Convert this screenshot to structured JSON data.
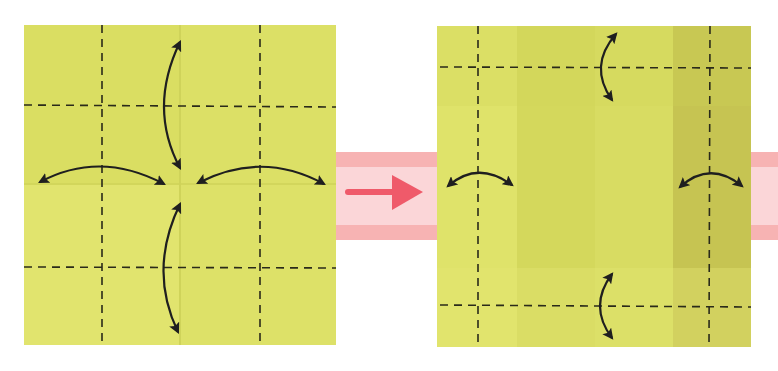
{
  "diagram": {
    "colors": {
      "paper_light": "#dfe36a",
      "paper_mid": "#d2d65a",
      "paper_dark": "#c3c150",
      "crease_line": "#2a2a1a",
      "arrow": "#1f1f1f",
      "band_outer": "#f7b3b3",
      "band_inner": "#fbd6d8",
      "step_arrow": "#ef5a6a",
      "background": "#ffffff"
    },
    "steps": [
      {
        "id": "step-1",
        "label": "Square with valley-fold creases at quarters; fold edges to center and unfold",
        "creases": {
          "vertical": 2,
          "horizontal": 2
        },
        "fold_arrows": [
          "top-edge-to-center",
          "bottom-edge-to-center",
          "left-edge-to-center",
          "right-edge-to-center"
        ]
      },
      {
        "id": "step-2",
        "label": "Fold corner strips in and unfold",
        "creases": {
          "vertical": 2,
          "horizontal": 2
        },
        "fold_arrows": [
          "top-flap",
          "bottom-flap",
          "left-flap",
          "right-flap"
        ]
      }
    ],
    "transition": {
      "icon": "right-arrow-icon",
      "direction": "right"
    }
  }
}
